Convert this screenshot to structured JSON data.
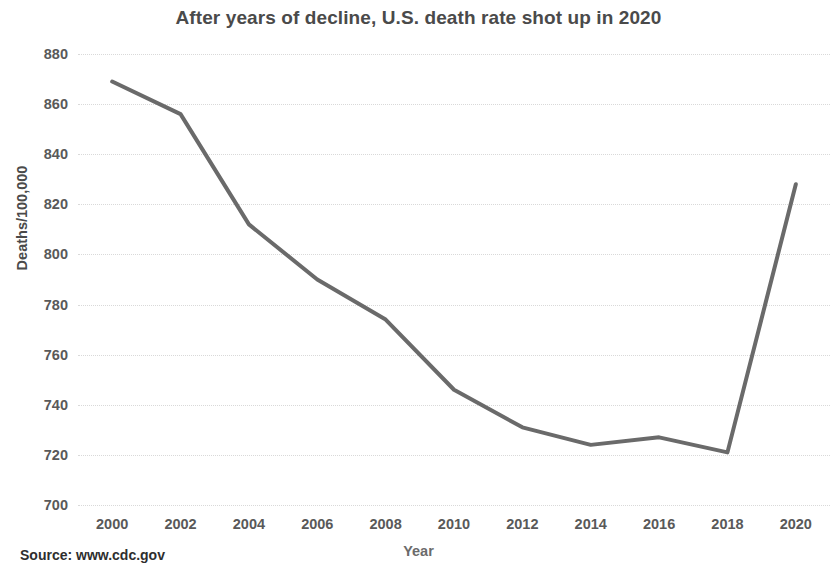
{
  "chart_data": {
    "type": "line",
    "title": "After years of decline, U.S. death rate shot up in 2020",
    "xlabel": "Year",
    "ylabel": "Deaths/100,000",
    "x": [
      2000,
      2002,
      2004,
      2006,
      2008,
      2010,
      2012,
      2014,
      2016,
      2018,
      2020
    ],
    "values": [
      869,
      856,
      812,
      790,
      774,
      746,
      731,
      724,
      727,
      721,
      828
    ],
    "series": [
      {
        "name": "U.S. death rate",
        "values": [
          869,
          856,
          812,
          790,
          774,
          746,
          731,
          724,
          727,
          721,
          828
        ]
      }
    ],
    "xtick_labels": [
      "2000",
      "2002",
      "2004",
      "2006",
      "2008",
      "2010",
      "2012",
      "2014",
      "2016",
      "2018",
      "2020"
    ],
    "ytick_labels": [
      "880",
      "860",
      "840",
      "820",
      "800",
      "780",
      "760",
      "740",
      "720",
      "700"
    ],
    "yticks": [
      880,
      860,
      840,
      820,
      800,
      780,
      760,
      740,
      720,
      700
    ],
    "xlim": [
      1999,
      2021
    ],
    "ylim": [
      700,
      880
    ],
    "grid": "horizontal",
    "legend": "none",
    "line_color": "#6a6a6a",
    "line_width": 4,
    "markers": "none"
  },
  "source": {
    "label": "Source: www.cdc.gov"
  }
}
